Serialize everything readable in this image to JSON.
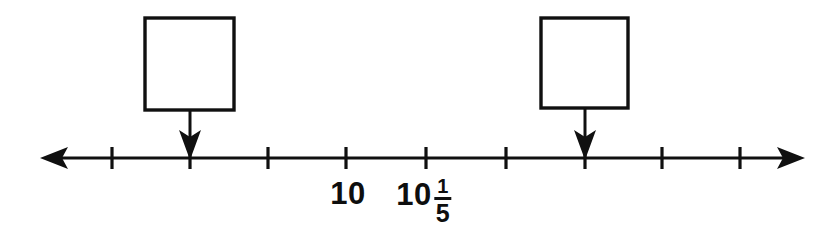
{
  "figure": {
    "kind": "number-line-diagram",
    "ink_color": "#101010",
    "background_color": "#ffffff",
    "axis": {
      "y": 158,
      "left_arrow_tip_x": 40,
      "right_arrow_tip_x": 805,
      "tick_count": 9,
      "tick_spacing_px": 78,
      "first_tick_x": 112,
      "tick_half_height": 11
    },
    "ticks": [
      {
        "index": 0,
        "x": 112,
        "label": ""
      },
      {
        "index": 1,
        "x": 190,
        "label": ""
      },
      {
        "index": 2,
        "x": 268,
        "label": ""
      },
      {
        "index": 3,
        "x": 346,
        "label": "10"
      },
      {
        "index": 4,
        "x": 426,
        "label": "10 1/5"
      },
      {
        "index": 5,
        "x": 506,
        "label": ""
      },
      {
        "index": 6,
        "x": 585,
        "label": ""
      },
      {
        "index": 7,
        "x": 662,
        "label": ""
      },
      {
        "index": 8,
        "x": 740,
        "label": ""
      }
    ],
    "labels": [
      {
        "name": "tick-label-10",
        "text": "10",
        "x": 348,
        "y": 178,
        "type": "whole"
      },
      {
        "name": "tick-label-10-and-one-fifth",
        "whole": "10",
        "numerator": "1",
        "denominator": "5",
        "x": 424,
        "y": 178,
        "type": "mixed"
      }
    ],
    "answer_boxes": [
      {
        "name": "answer-box-left",
        "value": "",
        "x": 145,
        "y": 18,
        "width": 89,
        "height": 92,
        "pointer_x": 190,
        "pointer_from_y": 110,
        "pointer_to_y": 156
      },
      {
        "name": "answer-box-right",
        "value": "",
        "x": 541,
        "y": 18,
        "width": 87,
        "height": 90,
        "pointer_x": 585,
        "pointer_from_y": 108,
        "pointer_to_y": 156
      }
    ]
  }
}
